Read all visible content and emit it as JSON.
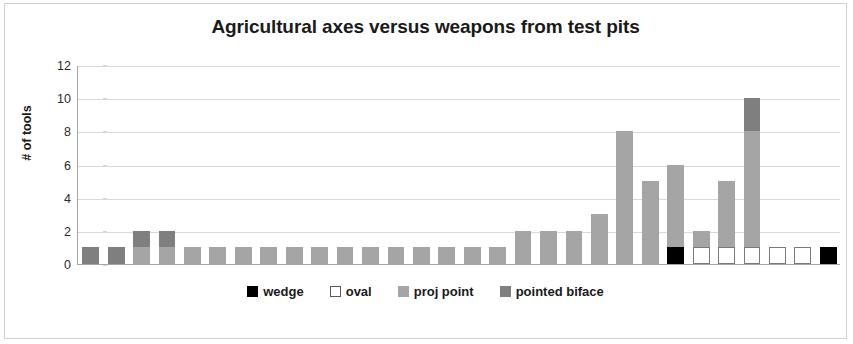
{
  "chart_data": {
    "type": "bar",
    "stacked": true,
    "title": "Agricultural axes versus weapons from test pits",
    "xlabel": "",
    "ylabel": "# of tools",
    "ylim": [
      0,
      12
    ],
    "yticks": [
      0,
      2,
      4,
      6,
      8,
      10,
      12
    ],
    "grid": true,
    "legend_position": "bottom",
    "categories": [
      "1",
      "2",
      "3",
      "4",
      "5",
      "6",
      "7",
      "8",
      "9",
      "10",
      "11",
      "12",
      "13",
      "14",
      "15",
      "16",
      "17",
      "18",
      "19",
      "20",
      "21",
      "22",
      "23",
      "24",
      "25",
      "26",
      "27",
      "28",
      "29",
      "30"
    ],
    "series": [
      {
        "name": "wedge",
        "color": "#000000",
        "values": [
          0,
          0,
          0,
          0,
          0,
          0,
          0,
          0,
          0,
          0,
          0,
          0,
          0,
          0,
          0,
          0,
          0,
          0,
          0,
          0,
          0,
          0,
          0,
          1,
          0,
          0,
          0,
          0,
          0,
          1
        ]
      },
      {
        "name": "oval",
        "color": "#ffffff",
        "values": [
          0,
          0,
          0,
          0,
          0,
          0,
          0,
          0,
          0,
          0,
          0,
          0,
          0,
          0,
          0,
          0,
          0,
          0,
          0,
          0,
          0,
          0,
          0,
          0,
          1,
          1,
          1,
          1,
          1,
          0
        ]
      },
      {
        "name": "proj point",
        "color": "#a5a5a5",
        "values": [
          0,
          0,
          1,
          1,
          1,
          1,
          1,
          1,
          1,
          1,
          1,
          1,
          1,
          1,
          1,
          1,
          1,
          2,
          2,
          2,
          3,
          8,
          5,
          5,
          1,
          4,
          7,
          0,
          0,
          0
        ]
      },
      {
        "name": "pointed biface",
        "color": "#7f7f7f",
        "values": [
          1,
          1,
          1,
          1,
          0,
          0,
          0,
          0,
          0,
          0,
          0,
          0,
          0,
          0,
          0,
          0,
          0,
          0,
          0,
          0,
          0,
          0,
          0,
          0,
          0,
          0,
          2,
          0,
          0,
          0
        ]
      }
    ],
    "totals": [
      1,
      1,
      2,
      2,
      1,
      1,
      1,
      1,
      1,
      1,
      1,
      1,
      1,
      1,
      1,
      1,
      1,
      2,
      2,
      2,
      3,
      8,
      5,
      6,
      2,
      5,
      10,
      1,
      1,
      1
    ]
  },
  "legend": {
    "items": [
      {
        "label": "wedge",
        "swatch": "wedge"
      },
      {
        "label": "oval",
        "swatch": "oval"
      },
      {
        "label": "proj point",
        "swatch": "projpoint"
      },
      {
        "label": "pointed biface",
        "swatch": "pointedbiface"
      }
    ]
  }
}
